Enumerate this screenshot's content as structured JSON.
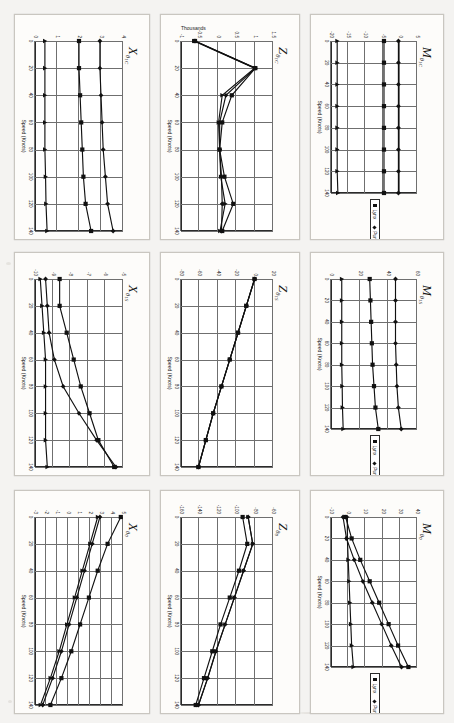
{
  "page": {
    "background": "#f4f3f1",
    "axis_title_x": "Speed (Knots)",
    "legend": {
      "entries": [
        {
          "label": "Lynx",
          "marker": "square"
        },
        {
          "label": "Puma",
          "marker": "diamond"
        },
        {
          "label": "Bo105",
          "marker": "triangle"
        }
      ]
    }
  },
  "chart_data": [
    {
      "id": "x-theta1c",
      "type": "line",
      "title_main": "X",
      "title_sub": "θ",
      "title_sub2": "1C",
      "xlabel": "Speed (Knots)",
      "ylabel": "",
      "x": [
        0,
        20,
        40,
        60,
        80,
        100,
        120,
        140
      ],
      "xticks": [
        0,
        20,
        40,
        60,
        80,
        100,
        120,
        140
      ],
      "yticks": [
        4,
        3,
        2,
        1,
        0
      ],
      "ylim": [
        0,
        4
      ],
      "xlim": [
        0,
        140
      ],
      "series": [
        {
          "name": "Lynx",
          "marker": "square",
          "values": [
            2.0,
            2.0,
            2.05,
            2.1,
            2.15,
            2.2,
            2.3,
            2.55
          ]
        },
        {
          "name": "Puma",
          "marker": "diamond",
          "values": [
            2.95,
            2.95,
            3.0,
            3.05,
            3.1,
            3.2,
            3.3,
            3.55
          ]
        },
        {
          "name": "Bo105",
          "marker": "triangle",
          "values": [
            0.45,
            0.45,
            0.45,
            0.45,
            0.45,
            0.48,
            0.5,
            0.55
          ]
        }
      ]
    },
    {
      "id": "z-theta1c",
      "type": "line",
      "title_main": "Z",
      "title_sub": "θ",
      "title_sub2": "1C",
      "xlabel": "Speed (Knots)",
      "ylabel": "Thousands",
      "x": [
        0,
        20,
        40,
        60,
        80,
        100,
        120,
        140
      ],
      "xticks": [
        0,
        20,
        40,
        60,
        80,
        100,
        120,
        140
      ],
      "yticks": [
        1.5,
        1,
        0.5,
        0,
        -0.5,
        -1
      ],
      "ylim": [
        -1,
        1.5
      ],
      "xlim": [
        0,
        140
      ],
      "series": [
        {
          "name": "Lynx",
          "marker": "square",
          "values": [
            -0.62,
            1.02,
            0.38,
            0.12,
            0.05,
            0.18,
            0.42,
            0.12
          ]
        },
        {
          "name": "Puma",
          "marker": "diamond",
          "values": [
            -0.62,
            1.02,
            0.22,
            0.05,
            0.05,
            0.1,
            0.12,
            0.1
          ]
        },
        {
          "name": "Bo105",
          "marker": "triangle",
          "values": [
            -0.65,
            1.0,
            0.12,
            0.02,
            0.05,
            0.08,
            0.2,
            0.06
          ]
        }
      ]
    },
    {
      "id": "m-theta1c",
      "type": "line",
      "title_main": "M",
      "title_sub": "θ",
      "title_sub2": "1C",
      "xlabel": "Speed (Knots)",
      "ylabel": "",
      "x": [
        0,
        20,
        40,
        60,
        80,
        100,
        120,
        140
      ],
      "xticks": [
        0,
        20,
        40,
        60,
        80,
        100,
        120,
        140
      ],
      "yticks": [
        5,
        0,
        -5,
        -10,
        -15,
        -20
      ],
      "ylim": [
        -20,
        5
      ],
      "xlim": [
        0,
        140
      ],
      "series": [
        {
          "name": "Lynx",
          "marker": "square",
          "values": [
            -4.6,
            -4.6,
            -4.6,
            -4.6,
            -4.6,
            -4.6,
            -4.6,
            -4.6
          ]
        },
        {
          "name": "Puma",
          "marker": "diamond",
          "values": [
            -0.4,
            -0.4,
            -0.4,
            -0.4,
            -0.4,
            -0.4,
            -0.4,
            -0.4
          ]
        },
        {
          "name": "Bo105",
          "marker": "triangle",
          "values": [
            -18.2,
            -18.2,
            -18.2,
            -18.2,
            -18.2,
            -18.2,
            -18.2,
            -18.0
          ]
        }
      ]
    },
    {
      "id": "x-theta1s",
      "type": "line",
      "title_main": "X",
      "title_sub": "θ",
      "title_sub2": "1S",
      "xlabel": "Speed (Knots)",
      "ylabel": "",
      "x": [
        0,
        20,
        40,
        60,
        80,
        100,
        120,
        140
      ],
      "xticks": [
        0,
        20,
        40,
        60,
        80,
        100,
        120,
        140
      ],
      "yticks": [
        -5,
        -6,
        -7,
        -8,
        -9,
        -10
      ],
      "ylim": [
        -10,
        -5
      ],
      "xlim": [
        0,
        140
      ],
      "series": [
        {
          "name": "Lynx",
          "marker": "square",
          "values": [
            -8.6,
            -8.6,
            -8.2,
            -7.8,
            -7.4,
            -6.9,
            -6.4,
            -5.5
          ]
        },
        {
          "name": "Puma",
          "marker": "diamond",
          "values": [
            -9.4,
            -9.3,
            -9.2,
            -8.9,
            -8.4,
            -7.5,
            -6.5,
            -5.4
          ]
        },
        {
          "name": "Bo105",
          "marker": "triangle",
          "values": [
            -9.7,
            -9.6,
            -9.5,
            -9.4,
            -9.4,
            -9.4,
            -9.4,
            -9.3
          ]
        }
      ]
    },
    {
      "id": "z-theta1s",
      "type": "line",
      "title_main": "Z",
      "title_sub": "θ",
      "title_sub2": "1S",
      "xlabel": "Speed (Knots)",
      "ylabel": "",
      "x": [
        0,
        20,
        40,
        60,
        80,
        100,
        120,
        140
      ],
      "xticks": [
        0,
        20,
        40,
        60,
        80,
        100,
        120,
        140
      ],
      "yticks": [
        20,
        0,
        -20,
        -40,
        -60,
        -80
      ],
      "ylim": [
        -80,
        20
      ],
      "xlim": [
        0,
        140
      ],
      "series": [
        {
          "name": "Lynx",
          "marker": "square",
          "values": [
            0,
            -9,
            -18,
            -27,
            -36,
            -45,
            -53,
            -61
          ]
        },
        {
          "name": "Puma",
          "marker": "diamond",
          "values": [
            0,
            -9,
            -18,
            -27,
            -36,
            -45,
            -53,
            -61
          ]
        },
        {
          "name": "Bo105",
          "marker": "triangle",
          "values": [
            0,
            -9,
            -18,
            -27,
            -36,
            -45,
            -53,
            -61
          ]
        }
      ]
    },
    {
      "id": "m-theta1s",
      "type": "line",
      "title_main": "M",
      "title_sub": "θ",
      "title_sub2": "1S",
      "xlabel": "Speed (Knots)",
      "ylabel": "",
      "x": [
        0,
        20,
        40,
        60,
        80,
        100,
        120,
        140
      ],
      "xticks": [
        0,
        20,
        40,
        60,
        80,
        100,
        120,
        140
      ],
      "yticks": [
        60,
        40,
        20,
        0
      ],
      "ylim": [
        0,
        60
      ],
      "xlim": [
        0,
        140
      ],
      "series": [
        {
          "name": "Lynx",
          "marker": "square",
          "values": [
            27,
            27.5,
            28,
            28.5,
            29,
            30,
            31,
            33
          ]
        },
        {
          "name": "Puma",
          "marker": "diamond",
          "values": [
            45,
            45,
            45,
            45,
            45.5,
            46,
            47,
            49
          ]
        },
        {
          "name": "Bo105",
          "marker": "triangle",
          "values": [
            7.5,
            7.5,
            7.5,
            7.5,
            7.5,
            7.8,
            8,
            8.5
          ]
        }
      ]
    },
    {
      "id": "x-theta0",
      "type": "line",
      "title_main": "X",
      "title_sub": "θ",
      "title_sub2": "0",
      "xlabel": "Speed (Knots)",
      "ylabel": "",
      "x": [
        0,
        20,
        40,
        60,
        80,
        100,
        120,
        140
      ],
      "xticks": [
        0,
        20,
        40,
        60,
        80,
        100,
        120,
        140
      ],
      "yticks": [
        5,
        4,
        3,
        2,
        1,
        0,
        -1,
        -2,
        -3
      ],
      "ylim": [
        -3,
        5
      ],
      "xlim": [
        0,
        140
      ],
      "series": [
        {
          "name": "Lynx",
          "marker": "square",
          "values": [
            4.8,
            3.6,
            2.7,
            1.9,
            1.1,
            0.3,
            -0.6,
            -1.6
          ]
        },
        {
          "name": "Puma",
          "marker": "diamond",
          "values": [
            2.9,
            2.2,
            1.5,
            0.8,
            0.1,
            -0.6,
            -1.4,
            -2.3
          ]
        },
        {
          "name": "Bo105",
          "marker": "triangle",
          "values": [
            2.7,
            2.0,
            1.3,
            0.6,
            -0.1,
            -0.8,
            -1.6,
            -2.5
          ]
        }
      ]
    },
    {
      "id": "z-theta0",
      "type": "line",
      "title_main": "Z",
      "title_sub": "θ",
      "title_sub2": "0",
      "xlabel": "Speed (Knots)",
      "ylabel": "",
      "x": [
        0,
        20,
        40,
        60,
        80,
        100,
        120,
        140
      ],
      "xticks": [
        0,
        20,
        40,
        60,
        80,
        100,
        120,
        140
      ],
      "yticks": [
        -60,
        -80,
        -100,
        -120,
        -140,
        -160
      ],
      "ylim": [
        -160,
        -60
      ],
      "xlim": [
        0,
        140
      ],
      "series": [
        {
          "name": "Lynx",
          "marker": "square",
          "values": [
            -93,
            -88,
            -97,
            -107,
            -117,
            -126,
            -135,
            -144
          ]
        },
        {
          "name": "Puma",
          "marker": "diamond",
          "values": [
            -87,
            -82,
            -92,
            -102,
            -112,
            -122,
            -131,
            -141
          ]
        },
        {
          "name": "Bo105",
          "marker": "triangle",
          "values": [
            -87,
            -82,
            -92,
            -102,
            -112,
            -122,
            -131,
            -141
          ]
        }
      ]
    },
    {
      "id": "m-theta0",
      "type": "line",
      "title_main": "M",
      "title_sub": "θ",
      "title_sub2": "0",
      "xlabel": "Speed (Knots)",
      "ylabel": "",
      "x": [
        0,
        20,
        40,
        60,
        80,
        100,
        120,
        140
      ],
      "xticks": [
        0,
        20,
        40,
        60,
        80,
        100,
        120,
        140
      ],
      "yticks": [
        40,
        30,
        20,
        10,
        0,
        -10
      ],
      "ylim": [
        -10,
        40
      ],
      "xlim": [
        0,
        140
      ],
      "series": [
        {
          "name": "Lynx",
          "marker": "square",
          "values": [
            -1.5,
            2.0,
            7.0,
            12.5,
            18.0,
            23.5,
            29.0,
            35.0
          ]
        },
        {
          "name": "Puma",
          "marker": "diamond",
          "values": [
            -3.0,
            -1.0,
            3.5,
            8.5,
            14.0,
            19.5,
            25.0,
            31.0
          ]
        },
        {
          "name": "Bo105",
          "marker": "triangle",
          "values": [
            -0.5,
            -0.5,
            0.0,
            0.5,
            1.0,
            1.5,
            2.0,
            3.0
          ]
        }
      ]
    }
  ]
}
